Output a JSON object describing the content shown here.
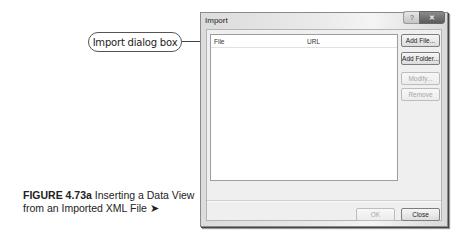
{
  "callout": {
    "label": "Import dialog box"
  },
  "caption": {
    "figure": "FIGURE 4.73a",
    "text": " Inserting a Data View from an Imported XML File",
    "arrow": "➤"
  },
  "dialog": {
    "title": "Import",
    "title_buttons": {
      "help": "?",
      "close": "✕"
    },
    "list": {
      "columns": [
        "File",
        "URL"
      ],
      "rows": []
    },
    "side_buttons": [
      {
        "label": "Add File...",
        "enabled": true
      },
      {
        "label": "Add Folder...",
        "enabled": true
      },
      {
        "label": "Modify...",
        "enabled": false
      },
      {
        "label": "Remove",
        "enabled": false
      }
    ],
    "footer_buttons": {
      "ok": {
        "label": "OK",
        "enabled": false
      },
      "close": {
        "label": "Close",
        "enabled": true
      }
    }
  }
}
